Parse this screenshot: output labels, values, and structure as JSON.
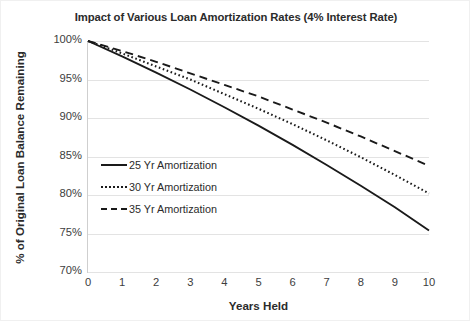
{
  "chart_data": {
    "type": "line",
    "title": "Impact of Various Loan Amortization Rates (4% Interest Rate)",
    "xlabel": "Years Held",
    "ylabel": "% of Original Loan Balance Remaining",
    "xlim": [
      0,
      10
    ],
    "ylim": [
      70,
      100
    ],
    "grid": true,
    "legend_position": "inside-left",
    "x": [
      0,
      1,
      2,
      3,
      4,
      5,
      6,
      7,
      8,
      9,
      10
    ],
    "xtick_labels": [
      "0",
      "1",
      "2",
      "3",
      "4",
      "5",
      "6",
      "7",
      "8",
      "9",
      "10"
    ],
    "ytick_labels": [
      "70%",
      "75%",
      "80%",
      "85%",
      "90%",
      "95%",
      "100%"
    ],
    "ytick_values": [
      70,
      75,
      80,
      85,
      90,
      95,
      100
    ],
    "series": [
      {
        "name": "25 Yr Amortization",
        "style": "solid",
        "color": "#1a1a1a",
        "values": [
          100.0,
          98.0,
          95.9,
          93.7,
          91.4,
          89.0,
          86.5,
          83.9,
          81.2,
          78.4,
          75.4
        ]
      },
      {
        "name": "30 Yr Amortization",
        "style": "dotted",
        "color": "#1a1a1a",
        "values": [
          100.0,
          98.4,
          96.7,
          95.0,
          93.1,
          91.2,
          89.2,
          87.1,
          84.9,
          82.6,
          80.2
        ]
      },
      {
        "name": "35 Yr Amortization",
        "style": "dashed",
        "color": "#1a1a1a",
        "values": [
          100.0,
          98.7,
          97.3,
          95.8,
          94.3,
          92.8,
          91.1,
          89.4,
          87.6,
          85.7,
          83.8
        ]
      }
    ]
  },
  "legend": {
    "items": [
      {
        "label": "25 Yr Amortization"
      },
      {
        "label": "30 Yr Amortization"
      },
      {
        "label": "35 Yr Amortization"
      }
    ]
  }
}
